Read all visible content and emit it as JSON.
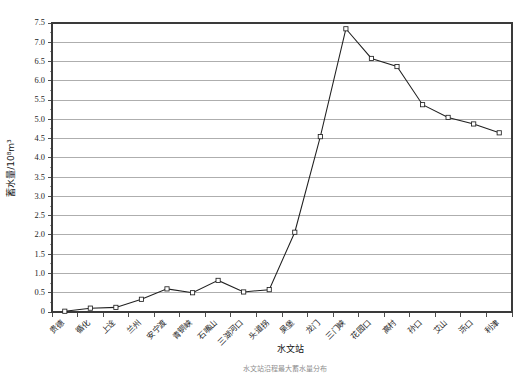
{
  "chart_data": {
    "type": "line",
    "title": "",
    "xlabel": "水文站",
    "ylabel": "蓄水量/10⁸m³",
    "ylim": [
      0,
      7.5
    ],
    "ytick_step": 0.5,
    "grid": true,
    "legend": "none",
    "marker": "open-square",
    "line_color": "#202020",
    "grid_color": "#8c8c8c",
    "categories": [
      "贵德",
      "循化",
      "上诠",
      "兰州",
      "安宁渡",
      "青铜峡",
      "石嘴山",
      "三湖河口",
      "头道拐",
      "吴堡",
      "龙门",
      "三门峡",
      "花园口",
      "高村",
      "孙口",
      "艾山",
      "泺口",
      "利津"
    ],
    "values": [
      0.02,
      0.1,
      0.12,
      0.33,
      0.6,
      0.5,
      0.82,
      0.52,
      0.58,
      2.07,
      4.55,
      7.35,
      6.58,
      6.37,
      5.38,
      5.05,
      4.88,
      4.65
    ],
    "ytick_labels": [
      "0",
      "0.5",
      "1.0",
      "1.5",
      "2.0",
      "2.5",
      "3.0",
      "3.5",
      "4.0",
      "4.5",
      "5.0",
      "5.5",
      "6.0",
      "6.5",
      "7.0",
      "7.5"
    ],
    "ytick_values": [
      0,
      0.5,
      1.0,
      1.5,
      2.0,
      2.5,
      3.0,
      3.5,
      4.0,
      4.5,
      5.0,
      5.5,
      6.0,
      6.5,
      7.0,
      7.5
    ]
  },
  "caption": {
    "text": "水文站沿程最大蓄水量分布"
  }
}
